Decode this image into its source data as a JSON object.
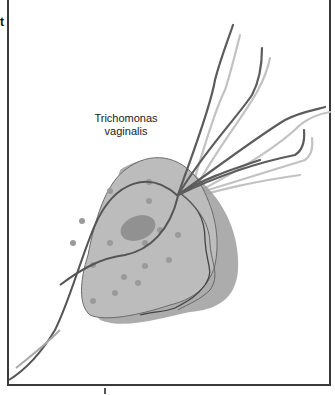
{
  "figure": {
    "edge_fragment_text": "t",
    "label": {
      "line1": "Trichomonas",
      "line2": "vaginalis"
    },
    "organism": "Trichomonas vaginalis",
    "parts_depicted": [
      "cell-body",
      "nucleus",
      "granules",
      "undulating-membrane",
      "anterior-flagella",
      "axostyle"
    ],
    "colors": {
      "body_fill": "#b8b8b8",
      "shadow": "#9a9a9a",
      "nucleus": "#8f8f8f",
      "flagella": "#5e5e5e",
      "flagella_shadow": "#bdbdbd",
      "frame": "#3a3a3a"
    }
  }
}
